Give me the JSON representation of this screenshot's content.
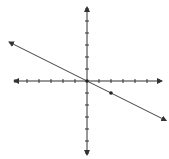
{
  "chart_data": {
    "type": "line",
    "title": "",
    "xlabel": "",
    "ylabel": "",
    "xlim": [
      -6,
      6
    ],
    "ylim": [
      -6,
      6
    ],
    "grid": false,
    "axes": {
      "x_ticks": [
        -6,
        -5,
        -4,
        -3,
        -2,
        -1,
        1,
        2,
        3,
        4,
        5,
        6
      ],
      "y_ticks": [
        -6,
        -5,
        -4,
        -3,
        -2,
        -1,
        1,
        2,
        3,
        4,
        5,
        6
      ],
      "arrows": true
    },
    "series": [
      {
        "name": "line",
        "slope": -0.5,
        "intercept": 0,
        "x": [
          -6.5,
          6.6
        ],
        "y": [
          3.25,
          -3.3
        ],
        "arrows": true
      }
    ],
    "points": [
      {
        "x": 0,
        "y": 0
      },
      {
        "x": 2,
        "y": -1
      }
    ]
  },
  "colors": {
    "axis": "#333333",
    "line": "#444444",
    "background": "#ffffff"
  }
}
